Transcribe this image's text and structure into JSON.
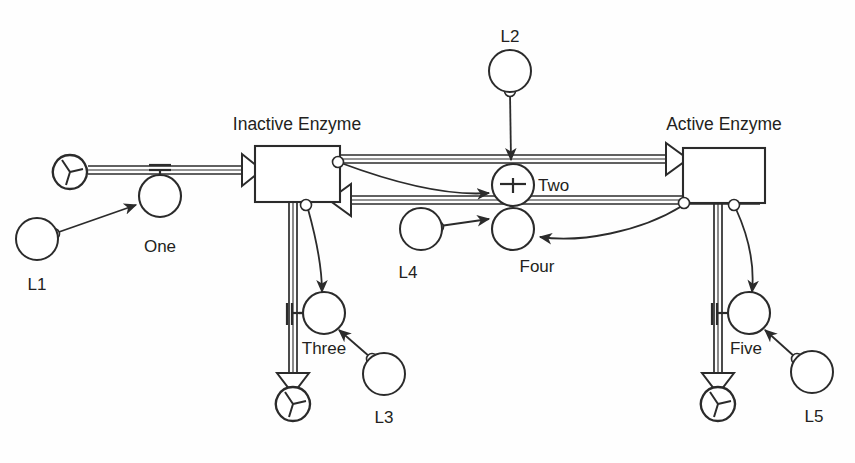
{
  "diagram": {
    "type": "stock-and-flow",
    "background_color": "#fefefe",
    "ink_color": "#2b2b2b",
    "text_color": "#231f20",
    "stocks": [
      {
        "id": "inactive-enzyme",
        "label": "Inactive Enzyme",
        "label_x": 297,
        "label_y": 130,
        "box": {
          "x": 255,
          "y": 146,
          "w": 85,
          "h": 56
        }
      },
      {
        "id": "active-enzyme",
        "label": "Active Enzyme",
        "label_x": 724,
        "label_y": 130,
        "box": {
          "x": 683,
          "y": 148,
          "w": 82,
          "h": 55
        }
      }
    ],
    "valves": [
      {
        "id": "valve-one",
        "label": "One",
        "cx": 160,
        "cy": 196,
        "r": 21,
        "label_x": 160,
        "label_y": 247
      },
      {
        "id": "valve-two",
        "label": "Two",
        "cx": 513,
        "cy": 185,
        "r": 21,
        "label_x": 556,
        "label_y": 191
      },
      {
        "id": "valve-three",
        "label": "Three",
        "cx": 324,
        "cy": 317,
        "r": 21,
        "label_x": 324,
        "label_y": 350
      },
      {
        "id": "valve-four",
        "label": "Four",
        "cx": 513,
        "cy": 229,
        "r": 21,
        "label_x": 537,
        "label_y": 270
      },
      {
        "id": "valve-five",
        "label": "Five",
        "cx": 748,
        "cy": 317,
        "r": 21,
        "label_x": 746,
        "label_y": 350
      }
    ],
    "auxiliaries": [
      {
        "id": "aux-l1",
        "label": "L1",
        "cx": 37,
        "cy": 239,
        "r": 21,
        "label_x": 37,
        "label_y": 285
      },
      {
        "id": "aux-l2",
        "label": "L2",
        "cx": 510,
        "cy": 71,
        "r": 21,
        "label_x": 510,
        "label_y": 38
      },
      {
        "id": "aux-l3",
        "label": "L3",
        "cx": 384,
        "cy": 374,
        "r": 21,
        "label_x": 384,
        "label_y": 419
      },
      {
        "id": "aux-l4",
        "label": "L4",
        "cx": 421,
        "cy": 229,
        "r": 21,
        "label_x": 408,
        "label_y": 274
      },
      {
        "id": "aux-l5",
        "label": "L5",
        "cx": 812,
        "cy": 372,
        "r": 21,
        "label_x": 814,
        "label_y": 418
      }
    ],
    "clouds": [
      {
        "id": "cloud-source-left",
        "cx": 70,
        "cy": 172,
        "r": 17,
        "role": "source"
      },
      {
        "id": "cloud-sink-inactive",
        "cx": 293,
        "cy": 404,
        "r": 17,
        "role": "sink"
      },
      {
        "id": "cloud-sink-active",
        "cx": 718,
        "cy": 404,
        "r": 17,
        "role": "sink"
      }
    ],
    "flows": [
      {
        "id": "flow-inflow-one",
        "from": "cloud-source-left",
        "to": "inactive-enzyme",
        "via": "valve-one",
        "direction": "right"
      },
      {
        "id": "flow-activation-two",
        "from": "inactive-enzyme",
        "to": "active-enzyme",
        "via": "valve-two",
        "direction": "right"
      },
      {
        "id": "flow-inactivation-four",
        "from": "active-enzyme",
        "to": "inactive-enzyme",
        "via": "valve-four",
        "direction": "left"
      },
      {
        "id": "flow-outflow-three",
        "from": "inactive-enzyme",
        "to": "cloud-sink-inactive",
        "via": "valve-three",
        "direction": "down"
      },
      {
        "id": "flow-outflow-five",
        "from": "active-enzyme",
        "to": "cloud-sink-active",
        "via": "valve-five",
        "direction": "down"
      }
    ],
    "connectors": [
      {
        "id": "conn-l1-one",
        "from": "aux-l1",
        "to": "valve-one"
      },
      {
        "id": "conn-l2-two",
        "from": "aux-l2",
        "to": "valve-two"
      },
      {
        "id": "conn-l3-three",
        "from": "aux-l3",
        "to": "valve-three"
      },
      {
        "id": "conn-l4-four",
        "from": "aux-l4",
        "to": "valve-four"
      },
      {
        "id": "conn-l5-five",
        "from": "aux-l5",
        "to": "valve-five"
      },
      {
        "id": "conn-inactive-two",
        "from": "inactive-enzyme",
        "to": "valve-two"
      },
      {
        "id": "conn-inactive-three",
        "from": "inactive-enzyme",
        "to": "valve-three"
      },
      {
        "id": "conn-active-four",
        "from": "active-enzyme",
        "to": "valve-four"
      },
      {
        "id": "conn-active-five",
        "from": "active-enzyme",
        "to": "valve-five"
      }
    ]
  }
}
